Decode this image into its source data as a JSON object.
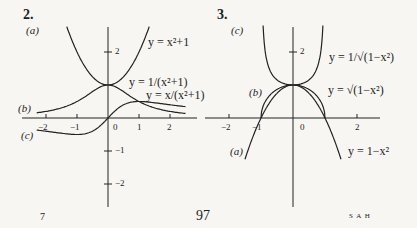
{
  "page": {
    "number": "97",
    "footer_left": "7",
    "footer_right": "S A H"
  },
  "chart_data": [
    {
      "id": "2",
      "type": "line",
      "title": "2.",
      "xlim": [
        -2.5,
        2.5
      ],
      "ylim": [
        -2.5,
        2.8
      ],
      "xticks": [
        -2,
        -1,
        0,
        1,
        2
      ],
      "yticks": [
        -2,
        -1,
        2
      ],
      "tick_labels": {
        "x": [
          "−2",
          "−1",
          "0",
          "1",
          "2"
        ],
        "y": [
          "2",
          "−1",
          "−2"
        ]
      },
      "grid": false,
      "series": [
        {
          "part": "(a)",
          "name": "y = x²+1",
          "formula": "x^2+1",
          "x_range": [
            -1.4,
            1.4
          ]
        },
        {
          "part": "(b)",
          "name": "y = 1/(x²+1)",
          "formula": "1/(x^2+1)",
          "x_range": [
            -2.3,
            2.5
          ]
        },
        {
          "part": "(c)",
          "name": "y = x/(x²+1)",
          "formula": "x/(x^2+1)",
          "x_range": [
            -2.3,
            2.5
          ]
        }
      ]
    },
    {
      "id": "3",
      "type": "line",
      "title": "3.",
      "xlim": [
        -2.5,
        2.5
      ],
      "ylim": [
        -2.5,
        2.8
      ],
      "xticks": [
        -2,
        -1,
        0,
        2
      ],
      "yticks": [
        2
      ],
      "tick_labels": {
        "x": [
          "−2",
          "−1",
          "0",
          "2"
        ],
        "y": [
          "2"
        ]
      },
      "grid": false,
      "series": [
        {
          "part": "(a)",
          "name": "y = 1−x²",
          "formula": "1-x^2",
          "x_range": [
            -1.5,
            1.5
          ]
        },
        {
          "part": "(b)",
          "name": "y = √(1−x²)",
          "formula": "sqrt(1-x^2)",
          "x_range": [
            -1,
            1
          ]
        },
        {
          "part": "(c)",
          "name": "y = 1/√(1−x²)",
          "formula": "1/sqrt(1-x^2)",
          "x_range": [
            -0.95,
            0.95
          ]
        }
      ]
    }
  ],
  "labels": {
    "c2": {
      "title": "2.",
      "a": "(a)",
      "b": "(b)",
      "c": "(c)",
      "eq_a": "y = x²+1",
      "eq_b": "y = 1/(x²+1)",
      "eq_c": "y = x/(x²+1)",
      "y2": "2",
      "ym1": "−1",
      "ym2": "−2",
      "xm2": "−2",
      "xm1": "−1",
      "x0": "0",
      "x1": "1",
      "x2": "2"
    },
    "c3": {
      "title": "3.",
      "a": "(a)",
      "b": "(b)",
      "c": "(c)",
      "eq_a": "y = 1−x²",
      "eq_b": "y = √(1−x²)",
      "eq_c": "y = 1/√(1−x²)",
      "y2": "2",
      "xm2": "−2",
      "xm1": "−1",
      "x0": "0",
      "x2": "2"
    }
  }
}
